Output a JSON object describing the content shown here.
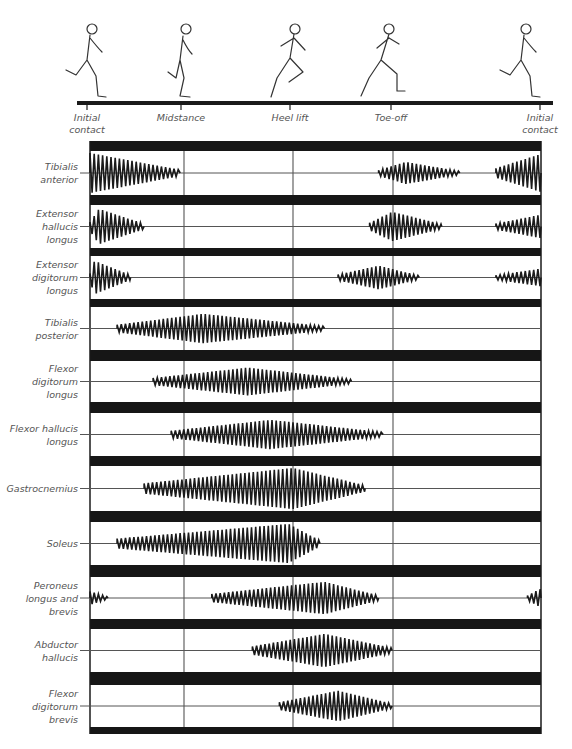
{
  "figure": {
    "type": "emg-gait-diagram",
    "timeline": {
      "phases": [
        {
          "label": "Initial\ncontact",
          "x": 87
        },
        {
          "label": "Midstance",
          "x": 181
        },
        {
          "label": "Heel lift",
          "x": 290
        },
        {
          "label": "Toe-off",
          "x": 391
        },
        {
          "label": "Initial\ncontact",
          "x": 540
        }
      ]
    },
    "runner_figures": [
      {
        "name": "runner-initial-contact",
        "x": 88
      },
      {
        "name": "runner-midstance",
        "x": 182
      },
      {
        "name": "runner-heel-lift",
        "x": 291
      },
      {
        "name": "runner-toe-off",
        "x": 385
      },
      {
        "name": "runner-initial-contact-2",
        "x": 522
      }
    ]
  },
  "chart_data": {
    "type": "emg-activity",
    "title": "",
    "x_axis": {
      "label": "Gait cycle (running)",
      "events": [
        "Initial contact",
        "Midstance",
        "Heel lift",
        "Toe-off",
        "Initial contact"
      ],
      "event_positions_pct": [
        0,
        21,
        45,
        67,
        100
      ]
    },
    "rows": [
      {
        "muscle": "Tibialis\nanterior",
        "bursts": [
          {
            "start": 0,
            "end": 20,
            "peak": 0,
            "max_amp": 1.0
          },
          {
            "start": 64,
            "end": 82,
            "peak": 70,
            "max_amp": 0.55
          },
          {
            "start": 90,
            "end": 100,
            "peak": 100,
            "max_amp": 0.95
          }
        ]
      },
      {
        "muscle": "Extensor\nhallucis\nlongus",
        "bursts": [
          {
            "start": 0,
            "end": 12,
            "peak": 2,
            "max_amp": 0.9
          },
          {
            "start": 62,
            "end": 78,
            "peak": 67,
            "max_amp": 0.75
          },
          {
            "start": 90,
            "end": 100,
            "peak": 100,
            "max_amp": 0.6
          }
        ]
      },
      {
        "muscle": "Extensor\ndigitorum\nlongus",
        "bursts": [
          {
            "start": 0,
            "end": 9,
            "peak": 1,
            "max_amp": 0.85
          },
          {
            "start": 55,
            "end": 73,
            "peak": 64,
            "max_amp": 0.6
          },
          {
            "start": 90,
            "end": 100,
            "peak": 100,
            "max_amp": 0.45
          }
        ]
      },
      {
        "muscle": "Tibialis\nposterior",
        "bursts": [
          {
            "start": 6,
            "end": 52,
            "peak": 25,
            "max_amp": 0.75
          }
        ]
      },
      {
        "muscle": "Flexor\ndigitorum\nlongus",
        "bursts": [
          {
            "start": 14,
            "end": 58,
            "peak": 35,
            "max_amp": 0.75
          }
        ]
      },
      {
        "muscle": "Flexor hallucis\nlongus",
        "bursts": [
          {
            "start": 18,
            "end": 65,
            "peak": 40,
            "max_amp": 0.75
          }
        ]
      },
      {
        "muscle": "Gastrocnemius",
        "bursts": [
          {
            "start": 12,
            "end": 61,
            "peak": 45,
            "max_amp": 1.0
          }
        ]
      },
      {
        "muscle": "Soleus",
        "bursts": [
          {
            "start": 6,
            "end": 51,
            "peak": 44,
            "max_amp": 1.0
          }
        ]
      },
      {
        "muscle": "Peroneus\nlongus and\nbrevis",
        "bursts": [
          {
            "start": 0,
            "end": 4,
            "peak": 0,
            "max_amp": 0.35
          },
          {
            "start": 27,
            "end": 64,
            "peak": 52,
            "max_amp": 0.85
          },
          {
            "start": 97,
            "end": 100,
            "peak": 100,
            "max_amp": 0.5
          }
        ]
      },
      {
        "muscle": "Abductor\nhallucis",
        "bursts": [
          {
            "start": 36,
            "end": 67,
            "peak": 52,
            "max_amp": 0.85
          }
        ]
      },
      {
        "muscle": "Flexor\ndigitorum\nbrevis",
        "bursts": [
          {
            "start": 42,
            "end": 67,
            "peak": 55,
            "max_amp": 0.8
          }
        ]
      }
    ],
    "grid": true,
    "legend": null
  },
  "colors": {
    "ink": "#1a1a1a",
    "bar": "#161616",
    "grid": "#555555",
    "label": "#555555",
    "background": "#ffffff"
  }
}
